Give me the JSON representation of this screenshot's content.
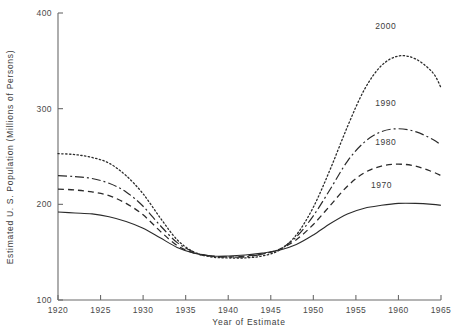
{
  "chart_data": {
    "type": "line",
    "title": "",
    "xlabel": "Year of Estimate",
    "ylabel": "Estimated U. S. Population (Millions of Persons)",
    "xlim": [
      1920,
      1965
    ],
    "ylim": [
      100,
      400
    ],
    "xticks": [
      1920,
      1925,
      1930,
      1935,
      1940,
      1945,
      1950,
      1955,
      1960,
      1965
    ],
    "xtick_labels": [
      "1920",
      "1925",
      "1930",
      "1935",
      "1940",
      "1945",
      "1950",
      "1955",
      "1960",
      "1965"
    ],
    "yticks": [
      100,
      200,
      300,
      400
    ],
    "ytick_labels": [
      "100",
      "200",
      "300",
      "400"
    ],
    "grid": false,
    "legend_position": "inline-right",
    "series": [
      {
        "name": "2000",
        "label": "2000",
        "linestyle": "dotted",
        "color": "#2b2b2b",
        "x": [
          1920,
          1922,
          1924,
          1926,
          1928,
          1930,
          1932,
          1934,
          1936,
          1938,
          1940,
          1942,
          1944,
          1946,
          1948,
          1950,
          1952,
          1954,
          1956,
          1958,
          1960,
          1962,
          1964,
          1965
        ],
        "values": [
          253,
          252,
          249,
          243,
          230,
          211,
          186,
          163,
          150,
          145,
          144,
          144,
          146,
          152,
          168,
          197,
          237,
          281,
          320,
          345,
          355,
          352,
          338,
          322
        ]
      },
      {
        "name": "1990",
        "label": "1990",
        "linestyle": "dashdot",
        "color": "#2b2b2b",
        "x": [
          1920,
          1922,
          1924,
          1926,
          1928,
          1930,
          1932,
          1934,
          1936,
          1938,
          1940,
          1942,
          1944,
          1946,
          1948,
          1950,
          1952,
          1954,
          1956,
          1958,
          1960,
          1962,
          1964,
          1965
        ],
        "values": [
          230,
          229,
          227,
          222,
          213,
          198,
          178,
          160,
          150,
          146,
          145,
          145,
          148,
          153,
          166,
          188,
          216,
          245,
          265,
          276,
          279,
          276,
          268,
          262
        ]
      },
      {
        "name": "1980",
        "label": "1980",
        "linestyle": "dashed",
        "color": "#2b2b2b",
        "x": [
          1920,
          1922,
          1924,
          1926,
          1928,
          1930,
          1932,
          1934,
          1936,
          1938,
          1940,
          1942,
          1944,
          1946,
          1948,
          1950,
          1952,
          1954,
          1956,
          1958,
          1960,
          1962,
          1964,
          1965
        ],
        "values": [
          216,
          215,
          213,
          209,
          201,
          189,
          172,
          157,
          149,
          146,
          145,
          146,
          148,
          153,
          163,
          179,
          199,
          219,
          233,
          240,
          242,
          240,
          234,
          230
        ]
      },
      {
        "name": "1970",
        "label": "1970",
        "linestyle": "solid",
        "color": "#2b2b2b",
        "x": [
          1920,
          1922,
          1924,
          1926,
          1928,
          1930,
          1932,
          1934,
          1936,
          1938,
          1940,
          1942,
          1944,
          1946,
          1948,
          1950,
          1952,
          1954,
          1956,
          1958,
          1960,
          1962,
          1964,
          1965
        ],
        "values": [
          192,
          191,
          190,
          187,
          182,
          175,
          165,
          155,
          149,
          146,
          146,
          147,
          149,
          152,
          158,
          168,
          180,
          190,
          196,
          199,
          201,
          201,
          200,
          199
        ]
      }
    ],
    "series_label_positions": [
      {
        "name": "2000",
        "x": 1958.5,
        "y": 383
      },
      {
        "name": "1990",
        "x": 1958.5,
        "y": 303
      },
      {
        "name": "1980",
        "x": 1958.5,
        "y": 262
      },
      {
        "name": "1970",
        "x": 1958.0,
        "y": 217
      }
    ]
  }
}
